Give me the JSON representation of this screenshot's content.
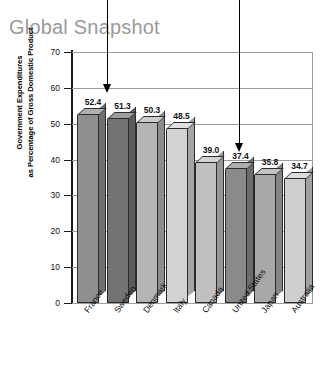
{
  "title": "Global Snapshot",
  "chart_data": {
    "type": "bar",
    "title": "Global Snapshot",
    "xlabel": "",
    "ylabel": "Government Expenditures as Percentage of Gross Domestic Product",
    "ylabel_line1": "Government Expenditures",
    "ylabel_line2": "as Percentage of Gross Domestic Product",
    "categories": [
      "France",
      "Sweden",
      "Denmark",
      "Italy",
      "Canada",
      "United States",
      "Japan",
      "Australia"
    ],
    "values": [
      52.4,
      51.3,
      50.3,
      48.5,
      39.0,
      37.4,
      35.8,
      34.7
    ],
    "value_labels": [
      "52.4",
      "51.3",
      "50.3",
      "48.5",
      "39.0",
      "37.4",
      "35.8",
      "34.7"
    ],
    "bar_colors": [
      "#8f8f8f",
      "#737373",
      "#b5b5b5",
      "#d2d2d2",
      "#c0c0c0",
      "#8a8a8a",
      "#a8a8a8",
      "#cfcfcf"
    ],
    "ylim": [
      0,
      70
    ],
    "yticks": [
      0,
      10,
      20,
      30,
      40,
      50,
      60,
      70
    ],
    "ytick_labels": [
      "0",
      "10",
      "20",
      "30",
      "40",
      "50",
      "60",
      "70"
    ],
    "grid": true,
    "legend": null,
    "annotations": [
      {
        "name": "arrow-france",
        "target": "France",
        "label": ""
      },
      {
        "name": "arrow-united-states",
        "target": "United States",
        "label": ""
      }
    ]
  },
  "colors": {
    "title": "#9a9a9a",
    "grid": "#9d9d9d",
    "axis": "#1a1a1a",
    "background": "#ffffff",
    "arrow": "#000000"
  }
}
